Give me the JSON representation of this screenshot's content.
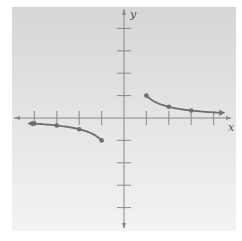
{
  "chart_data": {
    "type": "line",
    "title": "",
    "xlabel": "x",
    "ylabel": "y",
    "xlim": [
      -5,
      5
    ],
    "ylim": [
      -5,
      5
    ],
    "grid": false,
    "x_ticks": [
      -4,
      -3,
      -2,
      -1,
      1,
      2,
      3,
      4
    ],
    "y_ticks": [
      -4,
      -3,
      -2,
      -1,
      1,
      2,
      3,
      4
    ],
    "tick_labels_shown": false,
    "function": "y = 1/x",
    "series": [
      {
        "name": "right branch",
        "x": [
          1,
          2,
          3,
          4
        ],
        "y": [
          1,
          0.5,
          0.333,
          0.25
        ],
        "marked_points": [
          [
            1,
            1
          ],
          [
            2,
            0.5
          ],
          [
            3,
            0.333
          ]
        ],
        "arrow_end": "right"
      },
      {
        "name": "left branch",
        "x": [
          -4,
          -3,
          -2,
          -1
        ],
        "y": [
          -0.25,
          -0.333,
          -0.5,
          -1
        ],
        "marked_points": [
          [
            -4,
            -0.25
          ],
          [
            -3,
            -0.333
          ],
          [
            -2,
            -0.5
          ],
          [
            -1,
            -1
          ]
        ],
        "arrow_end": "left"
      }
    ],
    "colors": {
      "background_top": "#d9d9d9",
      "background_bottom": "#f2f2f2",
      "axis": "#8a8a8a",
      "curve": "#6e6e6e"
    }
  },
  "labels": {
    "x_axis": "x",
    "y_axis": "y"
  }
}
